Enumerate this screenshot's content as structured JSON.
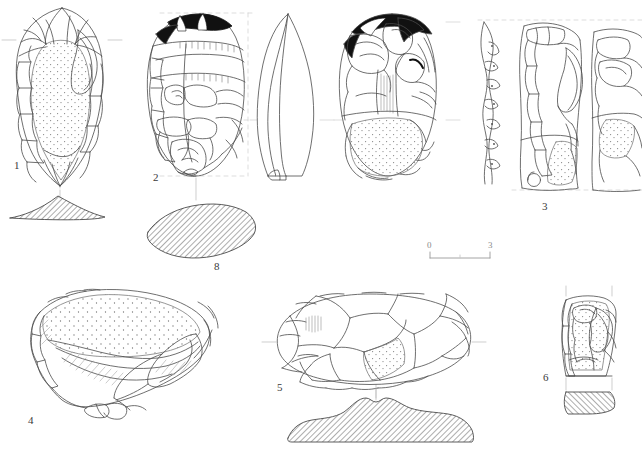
{
  "plate": {
    "title": "Lithic artefact illustration plate",
    "background_color": "#ffffff",
    "ink_color": "#4a4a4a",
    "solid_fill_color": "#111111",
    "width": 642,
    "height": 456
  },
  "figures": [
    {
      "id": "fig-1",
      "label": "1",
      "label_x": 14,
      "label_y": 160,
      "description": "Pointed handaxe, dorsal view with stippled cortex on body",
      "has_section": true,
      "section_style": "hatched",
      "section_label": ""
    },
    {
      "id": "fig-2",
      "label": "2",
      "label_x": 153,
      "label_y": 172,
      "description": "Ovate handaxe, dorsal view with black shaded flake scars, lateral profile and ventral view",
      "has_section": false,
      "section_style": "",
      "section_label": ""
    },
    {
      "id": "fig-8",
      "label": "8",
      "label_x": 214,
      "label_y": 261,
      "description": "Hatched cross-section of ovate handaxe",
      "has_section": true,
      "section_style": "hatched",
      "section_label": "8"
    },
    {
      "id": "fig-3",
      "label": "3",
      "label_x": 542,
      "label_y": 201,
      "description": "Blade core, profile view, frontal view and partial lateral view at plate edge",
      "has_section": false,
      "section_style": "",
      "section_label": ""
    },
    {
      "id": "fig-4",
      "label": "4",
      "label_x": 28,
      "label_y": 415,
      "description": "Large cortical flake / side scraper with stippled cortex surface",
      "has_section": false,
      "section_style": "",
      "section_label": ""
    },
    {
      "id": "fig-5",
      "label": "5",
      "label_x": 277,
      "label_y": 382,
      "description": "Oval discoidal biface, dorsal view with hatched cross-section below",
      "has_section": true,
      "section_style": "hatched",
      "section_label": ""
    },
    {
      "id": "fig-6",
      "label": "6",
      "label_x": 543,
      "label_y": 372,
      "description": "Small rectangular core fragment with hatched cross-section below",
      "has_section": true,
      "section_style": "hatched",
      "section_label": ""
    }
  ],
  "scale_bar": {
    "name": "scale-bar",
    "start_label": "0",
    "end_label": "3",
    "unit": "cm",
    "x": 430,
    "y": 252,
    "length_px": 60
  }
}
